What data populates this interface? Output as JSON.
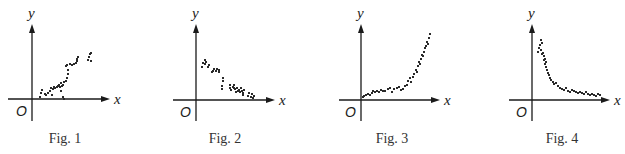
{
  "chart_data": [
    {
      "type": "scatter",
      "title": "Fig. 1",
      "xlabel": "x",
      "ylabel": "y",
      "origin_label": "O",
      "trend": "positive, roughly linear",
      "layout": {
        "origin": [
          32,
          99
        ],
        "x_axis": [
          8,
          110
        ],
        "y_axis": [
          24,
          121
        ],
        "caption_x": 65
      },
      "points": [
        [
          8,
          2
        ],
        [
          9,
          6
        ],
        [
          10,
          9
        ],
        [
          13,
          5
        ],
        [
          14,
          4
        ],
        [
          16,
          6
        ],
        [
          18,
          8
        ],
        [
          19,
          11
        ],
        [
          20,
          4
        ],
        [
          21,
          10
        ],
        [
          22,
          12
        ],
        [
          23,
          11
        ],
        [
          25,
          12
        ],
        [
          26,
          13
        ],
        [
          27,
          14
        ],
        [
          28,
          12
        ],
        [
          29,
          8
        ],
        [
          29,
          16
        ],
        [
          30,
          13
        ],
        [
          31,
          14
        ],
        [
          32,
          17
        ],
        [
          31,
          2
        ],
        [
          32,
          0
        ],
        [
          34,
          18
        ],
        [
          35,
          21
        ],
        [
          36,
          25
        ],
        [
          36,
          29
        ],
        [
          34,
          33
        ],
        [
          35,
          34
        ],
        [
          38,
          35
        ],
        [
          40,
          34
        ],
        [
          42,
          35
        ],
        [
          44,
          36
        ],
        [
          45,
          38
        ],
        [
          45,
          40
        ],
        [
          46,
          42
        ],
        [
          56,
          39
        ],
        [
          57,
          42
        ],
        [
          58,
          45
        ],
        [
          59,
          46
        ],
        [
          59,
          38
        ]
      ]
    },
    {
      "type": "scatter",
      "title": "Fig. 2",
      "xlabel": "x",
      "ylabel": "y",
      "origin_label": "O",
      "trend": "negative, roughly linear",
      "layout": {
        "origin": [
          196,
          100
        ],
        "x_axis": [
          173,
          275
        ],
        "y_axis": [
          24,
          121
        ],
        "caption_x": 225
      },
      "points": [
        [
          6,
          33
        ],
        [
          7,
          37
        ],
        [
          9,
          36
        ],
        [
          10,
          38
        ],
        [
          9,
          40
        ],
        [
          12,
          33
        ],
        [
          13,
          35
        ],
        [
          16,
          28
        ],
        [
          17,
          29
        ],
        [
          18,
          31
        ],
        [
          20,
          29
        ],
        [
          21,
          31
        ],
        [
          23,
          28
        ],
        [
          23,
          30
        ],
        [
          27,
          19
        ],
        [
          27,
          22
        ],
        [
          26,
          11
        ],
        [
          26,
          14
        ],
        [
          34,
          12
        ],
        [
          34,
          15
        ],
        [
          35,
          10
        ],
        [
          37,
          13
        ],
        [
          38,
          15
        ],
        [
          38,
          12
        ],
        [
          39,
          11
        ],
        [
          40,
          8
        ],
        [
          41,
          12
        ],
        [
          42,
          9
        ],
        [
          43,
          10
        ],
        [
          44,
          8
        ],
        [
          45,
          12
        ],
        [
          46,
          9
        ],
        [
          47,
          7
        ],
        [
          48,
          10
        ],
        [
          47,
          5
        ],
        [
          52,
          4
        ],
        [
          53,
          7
        ],
        [
          55,
          3
        ],
        [
          56,
          6
        ],
        [
          57,
          2
        ],
        [
          58,
          4
        ]
      ]
    },
    {
      "type": "scatter",
      "title": "Fig. 3",
      "xlabel": "x",
      "ylabel": "y",
      "origin_label": "O",
      "trend": "positive, exponential-like growth",
      "layout": {
        "origin": [
          361,
          100
        ],
        "x_axis": [
          339,
          440
        ],
        "y_axis": [
          24,
          121
        ],
        "caption_x": 392
      },
      "points": [
        [
          2,
          3
        ],
        [
          3,
          4
        ],
        [
          5,
          5
        ],
        [
          7,
          6
        ],
        [
          9,
          5
        ],
        [
          11,
          7
        ],
        [
          12,
          9
        ],
        [
          14,
          8
        ],
        [
          16,
          9
        ],
        [
          18,
          8
        ],
        [
          20,
          10
        ],
        [
          22,
          9
        ],
        [
          24,
          9
        ],
        [
          27,
          11
        ],
        [
          29,
          12
        ],
        [
          31,
          8
        ],
        [
          33,
          11
        ],
        [
          36,
          12
        ],
        [
          38,
          13
        ],
        [
          40,
          10
        ],
        [
          42,
          11
        ],
        [
          44,
          14
        ],
        [
          46,
          15
        ],
        [
          47,
          19
        ],
        [
          49,
          22
        ],
        [
          50,
          18
        ],
        [
          52,
          23
        ],
        [
          53,
          26
        ],
        [
          55,
          30
        ],
        [
          56,
          28
        ],
        [
          57,
          34
        ],
        [
          58,
          38
        ],
        [
          59,
          36
        ],
        [
          60,
          41
        ],
        [
          61,
          45
        ],
        [
          62,
          44
        ],
        [
          63,
          48
        ],
        [
          64,
          52
        ],
        [
          65,
          54
        ],
        [
          66,
          58
        ],
        [
          67,
          56
        ],
        [
          68,
          62
        ],
        [
          69,
          66
        ]
      ]
    },
    {
      "type": "scatter",
      "title": "Fig. 4",
      "xlabel": "x",
      "ylabel": "y",
      "origin_label": "O",
      "trend": "negative, decaying (inverse-like)",
      "layout": {
        "origin": [
          532,
          100
        ],
        "x_axis": [
          509,
          610
        ],
        "y_axis": [
          24,
          121
        ],
        "caption_x": 562
      },
      "points": [
        [
          6,
          48
        ],
        [
          7,
          52
        ],
        [
          8,
          55
        ],
        [
          9,
          50
        ],
        [
          10,
          46
        ],
        [
          9,
          60
        ],
        [
          10,
          57
        ],
        [
          11,
          47
        ],
        [
          12,
          44
        ],
        [
          13,
          41
        ],
        [
          14,
          38
        ],
        [
          12,
          40
        ],
        [
          13,
          36
        ],
        [
          14,
          33
        ],
        [
          15,
          30
        ],
        [
          16,
          27
        ],
        [
          17,
          25
        ],
        [
          18,
          22
        ],
        [
          19,
          20
        ],
        [
          21,
          18
        ],
        [
          22,
          16
        ],
        [
          24,
          17
        ],
        [
          26,
          14
        ],
        [
          28,
          12
        ],
        [
          30,
          11
        ],
        [
          32,
          10
        ],
        [
          34,
          12
        ],
        [
          36,
          9
        ],
        [
          38,
          8
        ],
        [
          40,
          10
        ],
        [
          42,
          9
        ],
        [
          44,
          8
        ],
        [
          46,
          7
        ],
        [
          48,
          8
        ],
        [
          50,
          7
        ],
        [
          52,
          6
        ],
        [
          54,
          8
        ],
        [
          56,
          6
        ],
        [
          58,
          5
        ],
        [
          60,
          6
        ],
        [
          62,
          5
        ],
        [
          64,
          4
        ],
        [
          66,
          6
        ],
        [
          68,
          5
        ]
      ]
    }
  ],
  "captions": [
    "Fig. 1",
    "Fig. 2",
    "Fig. 3",
    "Fig. 4"
  ]
}
